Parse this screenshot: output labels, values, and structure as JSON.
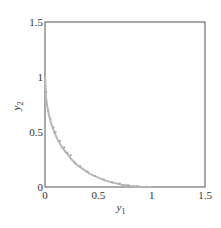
{
  "chart_data": {
    "type": "scatter",
    "title": "",
    "xlabel": "y1",
    "ylabel": "y2",
    "xlim": [
      0,
      1.5
    ],
    "ylim": [
      0,
      1.5
    ],
    "grid": false,
    "legend": null,
    "x_ticks": [
      "0",
      "0.5",
      "1",
      "1.5"
    ],
    "y_ticks": [
      "0",
      "0.5",
      "1",
      "1.5"
    ],
    "x_tick_values": [
      0,
      0.5,
      1,
      1.5
    ],
    "y_tick_values": [
      0,
      0.5,
      1,
      1.5
    ],
    "series": [
      {
        "name": "front",
        "color": "#b8b8b8",
        "kind": "line",
        "x": [
          0,
          0.01,
          0.02,
          0.04,
          0.06,
          0.09,
          0.12,
          0.16,
          0.2,
          0.25,
          0.3,
          0.36,
          0.42,
          0.49,
          0.56,
          0.64,
          0.72,
          0.81,
          0.9,
          1.0
        ],
        "y": [
          1.0,
          0.81,
          0.74,
          0.64,
          0.57,
          0.49,
          0.43,
          0.36,
          0.31,
          0.25,
          0.2,
          0.16,
          0.12,
          0.09,
          0.06,
          0.04,
          0.02,
          0.01,
          0.003,
          0.0
        ]
      },
      {
        "name": "samples",
        "color": "#a8a8a8",
        "kind": "points",
        "x": [
          0.0,
          0.01,
          0.03,
          0.05,
          0.08,
          0.1,
          0.14,
          0.18,
          0.21,
          0.24,
          0.28,
          0.33,
          0.4,
          0.47,
          0.55,
          0.63,
          0.7,
          0.78,
          0.86,
          0.95
        ],
        "y": [
          1.02,
          0.86,
          0.7,
          0.62,
          0.54,
          0.5,
          0.42,
          0.36,
          0.31,
          0.29,
          0.22,
          0.19,
          0.14,
          0.1,
          0.07,
          0.04,
          0.03,
          0.015,
          0.005,
          0.002
        ]
      }
    ]
  },
  "plot": {
    "axis_color": "#555555",
    "curve_color": "#b8b8b8"
  }
}
